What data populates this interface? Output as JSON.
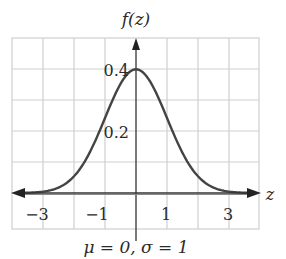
{
  "chart_data": {
    "type": "line",
    "title": "",
    "ylabel": "f(z)",
    "xlabel": "z",
    "caption": "μ = 0, σ = 1",
    "xlim": [
      -4,
      4
    ],
    "ylim": [
      0,
      0.5
    ],
    "grid": true,
    "x_ticks": [
      -3,
      -1,
      1,
      3
    ],
    "x_tick_labels": [
      "−3",
      "−1",
      "1",
      "3"
    ],
    "y_ticks": [
      0.2,
      0.4
    ],
    "y_tick_labels": [
      "0.2",
      "0.4"
    ],
    "series": [
      {
        "name": "standard normal density",
        "x": [
          -4,
          -3.5,
          -3,
          -2.5,
          -2,
          -1.5,
          -1,
          -0.5,
          0,
          0.5,
          1,
          1.5,
          2,
          2.5,
          3,
          3.5,
          4
        ],
        "values": [
          0.0001,
          0.0009,
          0.0044,
          0.0175,
          0.054,
          0.1295,
          0.242,
          0.3521,
          0.3989,
          0.3521,
          0.242,
          0.1295,
          0.054,
          0.0175,
          0.0044,
          0.0009,
          0.0001
        ]
      }
    ],
    "params": {
      "mu": 0,
      "sigma": 1
    }
  },
  "labels": {
    "y_axis": "f(z)",
    "x_axis": "z",
    "caption": "μ = 0, σ = 1",
    "y_tick_04": "0.4",
    "y_tick_02": "0.2",
    "x_tick_m3": "−3",
    "x_tick_m1": "−1",
    "x_tick_1": "1",
    "x_tick_3": "3"
  },
  "colors": {
    "curve": "#444444",
    "grid": "#cfcfcf",
    "axis": "#333333",
    "text": "#2a2a2a"
  }
}
